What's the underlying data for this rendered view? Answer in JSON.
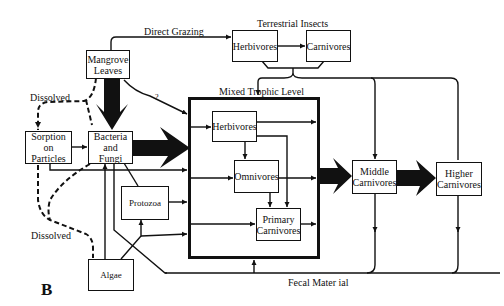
{
  "panel_label": "B",
  "nodes": {
    "mangrove_leaves": "Mangrove Leaves",
    "terrestrial_herbivores": "Herbivores",
    "terrestrial_carnivores": "Carnivores",
    "sorption": "Sorption on Particles",
    "bacteria_fungi": "Bacteria and Fungi",
    "protozoa": "Protozoa",
    "algae": "Algae",
    "mixed_herbivores": "Herbivores",
    "mixed_omnivores": "Omnivores",
    "mixed_primary_carnivores": "Primary Carnivores",
    "middle_carnivores": "Middle Carnivores",
    "higher_carnivores": "Higher Carnivores"
  },
  "groups": {
    "terrestrial_insects": "Terrestrial Insects",
    "mixed_trophic_level": "Mixed Trophic Level"
  },
  "edge_labels": {
    "direct_grazing": "Direct Grazing",
    "dissolved_top": "Dissolved",
    "dissolved_bottom": "Dissolved",
    "question": "?",
    "fecal_material": "Fecal Mater ial"
  },
  "colors": {
    "line": "#111111",
    "background": "#ffffff"
  }
}
